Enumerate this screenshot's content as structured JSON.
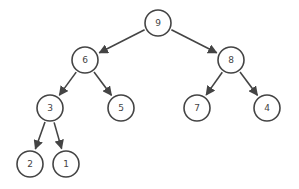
{
  "diagram": {
    "type": "binary-tree",
    "colors": {
      "stroke": "#444444",
      "fill": "#ffffff",
      "text": "#444444",
      "background": "#ffffff"
    },
    "node_radius": 13,
    "nodes": [
      {
        "id": "n9",
        "label": "9",
        "x": 158,
        "y": 23
      },
      {
        "id": "n6",
        "label": "6",
        "x": 85,
        "y": 60
      },
      {
        "id": "n8",
        "label": "8",
        "x": 231,
        "y": 60
      },
      {
        "id": "n3",
        "label": "3",
        "x": 50,
        "y": 108
      },
      {
        "id": "n5",
        "label": "5",
        "x": 121,
        "y": 108
      },
      {
        "id": "n7",
        "label": "7",
        "x": 197,
        "y": 108
      },
      {
        "id": "n4",
        "label": "4",
        "x": 267,
        "y": 108
      },
      {
        "id": "n2",
        "label": "2",
        "x": 30,
        "y": 164
      },
      {
        "id": "n1",
        "label": "1",
        "x": 66,
        "y": 164
      }
    ],
    "edges": [
      {
        "from": "n9",
        "to": "n6"
      },
      {
        "from": "n9",
        "to": "n8"
      },
      {
        "from": "n6",
        "to": "n3"
      },
      {
        "from": "n6",
        "to": "n5"
      },
      {
        "from": "n8",
        "to": "n7"
      },
      {
        "from": "n8",
        "to": "n4"
      },
      {
        "from": "n3",
        "to": "n2"
      },
      {
        "from": "n3",
        "to": "n1"
      }
    ]
  }
}
